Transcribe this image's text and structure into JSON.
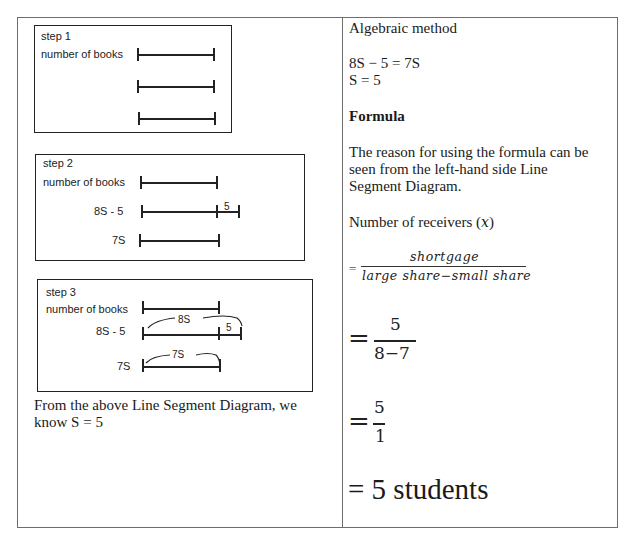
{
  "left_column": {
    "step1": {
      "title": "step 1",
      "row_label": "number of books"
    },
    "step2": {
      "title": "step 2",
      "rows": [
        "number of books",
        "8S - 5",
        "7S"
      ],
      "segment_label": "5"
    },
    "step3": {
      "title": "step 3",
      "rows": [
        "number of books",
        "8S - 5",
        "7S"
      ],
      "brace_8s": "8S",
      "segment_label": "5",
      "brace_7s": "7S"
    },
    "caption_line1": "From the above Line Segment Diagram, we",
    "caption_line2": "know S = 5"
  },
  "right_column": {
    "heading": "Algebraic method",
    "equation1": "8S − 5 = 7S",
    "equation2": "S = 5",
    "formula_heading": "Formula",
    "reason_line1": "The reason for using the formula can be",
    "reason_line2": "seen from the left-hand side Line",
    "reason_line3": "Segment Diagram.",
    "receivers_label": "Number of receivers (",
    "receivers_var": "x",
    "receivers_close": ")",
    "formula_eq": "=",
    "formula_numerator": "shortgage",
    "formula_denominator": "large share−small share",
    "step_a_eq": "=",
    "step_a_num": "5",
    "step_a_den": "8−7",
    "step_b_eq": "=",
    "step_b_num": "5",
    "step_b_den": "1",
    "result": "= 5 students"
  }
}
